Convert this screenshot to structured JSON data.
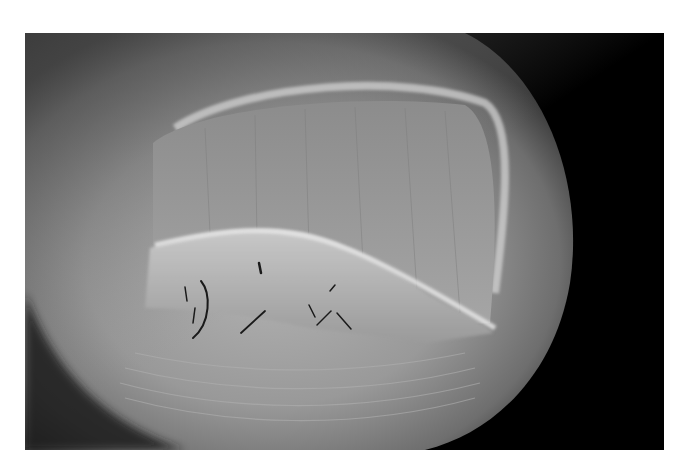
{
  "image": {
    "subject": "close-up grayscale photograph of a fingertip and nail",
    "frame": {
      "x": 25,
      "y": 33,
      "width": 639,
      "height": 417
    },
    "colors": {
      "background": "#ffffff",
      "shadow": "#000000",
      "skin_light": "#b8b8b8",
      "skin_mid": "#8a8a8a",
      "skin_dark": "#3c3c3c",
      "scale": "#dcdcdc"
    }
  }
}
